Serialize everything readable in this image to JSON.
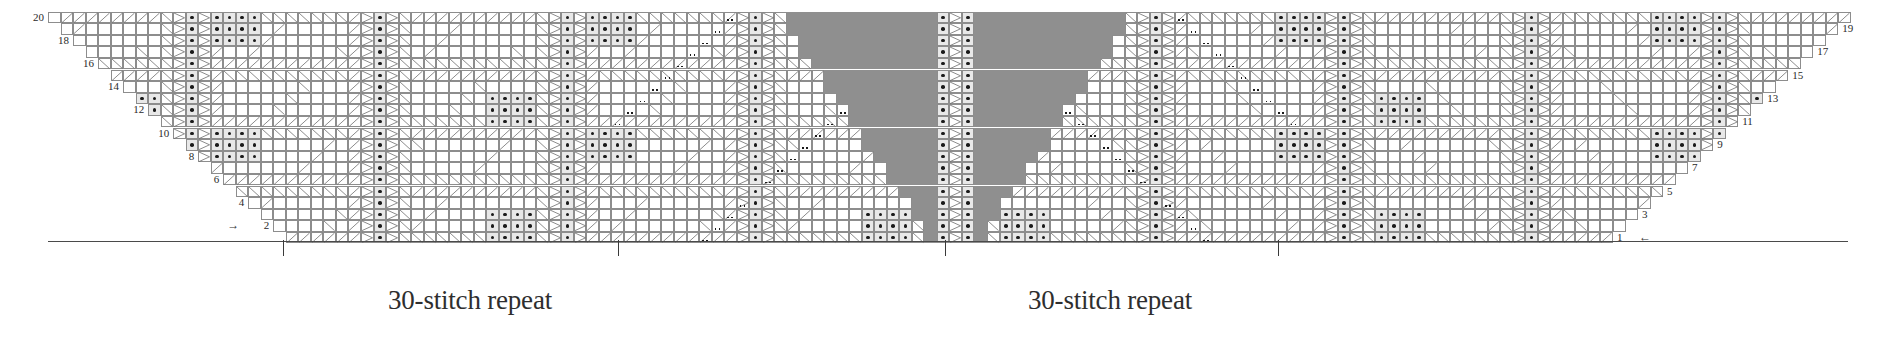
{
  "chart": {
    "type": "knitting-chart",
    "stitch_columns": 144,
    "rows_total": 20,
    "cell_width": 12.52,
    "cell_height": 11.6,
    "colors": {
      "grid_line": "#8d8d8d",
      "symbol_line": "#6f8f6f",
      "purl_dot": "#1a1a1a",
      "no_stitch_fill": "#8f8f8f",
      "shaded_cell": "#e8e8e8",
      "background": "#ffffff",
      "baseline": "#4a4a4a"
    },
    "row_numbers_left": [
      {
        "row": 20,
        "label": "20"
      },
      {
        "row": 18,
        "label": "18"
      },
      {
        "row": 16,
        "label": "16"
      },
      {
        "row": 14,
        "label": "14"
      },
      {
        "row": 12,
        "label": "12"
      },
      {
        "row": 10,
        "label": "10"
      },
      {
        "row": 8,
        "label": "8"
      },
      {
        "row": 6,
        "label": "6"
      },
      {
        "row": 4,
        "label": "4"
      },
      {
        "row": 2,
        "label": "2"
      }
    ],
    "row_numbers_right": [
      {
        "row": 19,
        "label": "19"
      },
      {
        "row": 17,
        "label": "17"
      },
      {
        "row": 15,
        "label": "15"
      },
      {
        "row": 13,
        "label": "13"
      },
      {
        "row": 11,
        "label": "11"
      },
      {
        "row": 9,
        "label": "9"
      },
      {
        "row": 7,
        "label": "7"
      },
      {
        "row": 5,
        "label": "5"
      },
      {
        "row": 3,
        "label": "3"
      },
      {
        "row": 1,
        "label": "1"
      }
    ],
    "direction_arrows": [
      {
        "name": "row-2-direction-arrow",
        "glyph": "→",
        "row": 2,
        "side": "left"
      },
      {
        "name": "row-1-direction-arrow",
        "glyph": "←",
        "row": 1,
        "side": "right"
      }
    ],
    "repeat_labels": [
      {
        "name": "left-repeat-label",
        "text": "30-stitch repeat",
        "center_x": 470
      },
      {
        "name": "right-repeat-label",
        "text": "30-stitch repeat",
        "center_x": 1110
      }
    ],
    "repeat_ticks_x": [
      283,
      618,
      945,
      1278
    ]
  }
}
